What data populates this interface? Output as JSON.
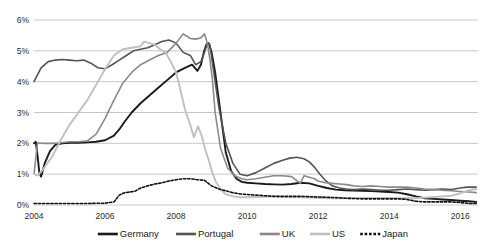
{
  "chart_data": {
    "type": "line",
    "title": "",
    "xlabel": "",
    "ylabel": "",
    "xlim": [
      2004.0,
      2016.5
    ],
    "ylim": [
      0,
      6
    ],
    "ytick_labels": [
      "0%",
      "1%",
      "2%",
      "3%",
      "4%",
      "5%",
      "6%"
    ],
    "ytick_values": [
      0,
      1,
      2,
      3,
      4,
      5,
      6
    ],
    "xtick_labels": [
      "2004",
      "2006",
      "2008",
      "2010",
      "2012",
      "2014",
      "2016"
    ],
    "xtick_values": [
      2004,
      2006,
      2008,
      2010,
      2012,
      2014,
      2016
    ],
    "grid": "horizontal",
    "legend_position": "bottom",
    "series": [
      {
        "name": "Germany",
        "color": "#1a1a1a",
        "width": 1.9,
        "dash": "none",
        "x": [
          2004.0,
          2004.05,
          2004.1,
          2004.15,
          2004.2,
          2004.3,
          2004.45,
          2004.6,
          2004.8,
          2005.0,
          2005.25,
          2005.5,
          2005.75,
          2006.0,
          2006.25,
          2006.4,
          2006.55,
          2006.75,
          2007.0,
          2007.25,
          2007.5,
          2007.75,
          2008.0,
          2008.25,
          2008.45,
          2008.6,
          2008.7,
          2008.78,
          2008.85,
          2008.92,
          2009.0,
          2009.1,
          2009.25,
          2009.4,
          2009.55,
          2009.7,
          2009.85,
          2010.0,
          2010.25,
          2010.5,
          2010.75,
          2011.0,
          2011.25,
          2011.5,
          2011.75,
          2012.0,
          2012.25,
          2012.5,
          2012.75,
          2013.0,
          2013.25,
          2013.5,
          2013.75,
          2014.0,
          2014.25,
          2014.5,
          2014.75,
          2015.0,
          2015.25,
          2015.5,
          2015.75,
          2016.0,
          2016.25,
          2016.45
        ],
        "y": [
          2.0,
          2.05,
          1.6,
          1.05,
          0.92,
          1.35,
          1.75,
          1.95,
          2.0,
          2.02,
          2.02,
          2.03,
          2.05,
          2.1,
          2.25,
          2.45,
          2.7,
          3.0,
          3.3,
          3.55,
          3.8,
          4.05,
          4.3,
          4.45,
          4.55,
          4.35,
          4.55,
          4.95,
          5.2,
          5.25,
          4.95,
          4.3,
          3.0,
          1.7,
          1.1,
          0.85,
          0.75,
          0.72,
          0.7,
          0.68,
          0.67,
          0.66,
          0.68,
          0.72,
          0.7,
          0.62,
          0.55,
          0.5,
          0.48,
          0.47,
          0.46,
          0.45,
          0.44,
          0.42,
          0.4,
          0.35,
          0.28,
          0.22,
          0.2,
          0.18,
          0.16,
          0.14,
          0.12,
          0.1
        ]
      },
      {
        "name": "Portugal",
        "color": "#545454",
        "width": 1.6,
        "dash": "none",
        "x": [
          2004.0,
          2004.2,
          2004.4,
          2004.6,
          2004.8,
          2005.0,
          2005.2,
          2005.4,
          2005.6,
          2005.8,
          2006.0,
          2006.2,
          2006.4,
          2006.6,
          2006.8,
          2007.0,
          2007.2,
          2007.4,
          2007.6,
          2007.8,
          2008.0,
          2008.2,
          2008.4,
          2008.55,
          2008.7,
          2008.8,
          2008.88,
          2008.95,
          2009.05,
          2009.2,
          2009.4,
          2009.6,
          2009.8,
          2010.0,
          2010.25,
          2010.5,
          2010.75,
          2011.0,
          2011.2,
          2011.4,
          2011.6,
          2011.75,
          2011.9,
          2012.05,
          2012.2,
          2012.4,
          2012.6,
          2012.8,
          2013.0,
          2013.25,
          2013.5,
          2013.75,
          2014.0,
          2014.25,
          2014.5,
          2014.75,
          2015.0,
          2015.25,
          2015.5,
          2015.75,
          2016.0,
          2016.2,
          2016.45
        ],
        "y": [
          4.0,
          4.45,
          4.65,
          4.7,
          4.72,
          4.7,
          4.68,
          4.7,
          4.6,
          4.45,
          4.42,
          4.55,
          4.7,
          4.85,
          5.0,
          5.05,
          5.1,
          5.2,
          5.3,
          5.35,
          5.25,
          4.95,
          4.85,
          4.55,
          4.65,
          4.95,
          5.25,
          5.2,
          4.4,
          3.2,
          2.0,
          1.35,
          1.0,
          0.95,
          1.05,
          1.2,
          1.35,
          1.45,
          1.52,
          1.55,
          1.5,
          1.4,
          1.22,
          1.0,
          0.8,
          0.62,
          0.55,
          0.52,
          0.5,
          0.52,
          0.5,
          0.48,
          0.48,
          0.5,
          0.52,
          0.5,
          0.48,
          0.5,
          0.52,
          0.5,
          0.55,
          0.58,
          0.58
        ]
      },
      {
        "name": "UK",
        "color": "#8a8a8a",
        "width": 1.6,
        "dash": "none",
        "x": [
          2004.0,
          2004.1,
          2004.25,
          2004.5,
          2004.75,
          2005.0,
          2005.25,
          2005.5,
          2005.75,
          2006.0,
          2006.25,
          2006.5,
          2006.75,
          2007.0,
          2007.25,
          2007.5,
          2007.75,
          2008.0,
          2008.2,
          2008.4,
          2008.55,
          2008.7,
          2008.8,
          2008.88,
          2008.95,
          2009.02,
          2009.1,
          2009.25,
          2009.45,
          2009.65,
          2009.85,
          2010.0,
          2010.25,
          2010.5,
          2010.75,
          2011.0,
          2011.25,
          2011.5,
          2011.6,
          2011.75,
          2011.9,
          2012.0,
          2012.2,
          2012.4,
          2012.6,
          2012.8,
          2013.0,
          2013.25,
          2013.5,
          2013.75,
          2014.0,
          2014.25,
          2014.5,
          2014.75,
          2015.0,
          2015.25,
          2015.5,
          2015.75,
          2016.0,
          2016.25,
          2016.45
        ],
        "y": [
          1.0,
          2.02,
          2.0,
          2.0,
          2.02,
          2.05,
          2.05,
          2.08,
          2.3,
          2.8,
          3.4,
          3.95,
          4.3,
          4.55,
          4.7,
          4.85,
          4.95,
          5.25,
          5.55,
          5.4,
          5.38,
          5.42,
          5.55,
          5.25,
          4.75,
          4.1,
          3.0,
          1.85,
          1.2,
          0.95,
          0.85,
          0.82,
          0.85,
          0.9,
          0.95,
          0.95,
          0.92,
          0.7,
          0.95,
          0.9,
          0.85,
          0.78,
          0.72,
          0.7,
          0.68,
          0.66,
          0.62,
          0.6,
          0.62,
          0.6,
          0.58,
          0.58,
          0.58,
          0.55,
          0.52,
          0.5,
          0.48,
          0.46,
          0.44,
          0.42,
          0.4
        ]
      },
      {
        "name": "US",
        "color": "#c0c0c0",
        "width": 1.9,
        "dash": "none",
        "x": [
          2004.0,
          2004.1,
          2004.25,
          2004.5,
          2004.75,
          2005.0,
          2005.25,
          2005.5,
          2005.75,
          2006.0,
          2006.25,
          2006.5,
          2006.75,
          2007.0,
          2007.1,
          2007.25,
          2007.4,
          2007.55,
          2007.7,
          2007.85,
          2008.0,
          2008.15,
          2008.25,
          2008.4,
          2008.5,
          2008.62,
          2008.72,
          2008.82,
          2008.92,
          2009.02,
          2009.12,
          2009.25,
          2009.4,
          2009.6,
          2009.8,
          2010.0,
          2010.25,
          2010.5,
          2010.75,
          2011.0,
          2011.25,
          2011.5,
          2011.75,
          2012.0,
          2012.25,
          2012.5,
          2012.75,
          2013.0,
          2013.25,
          2013.5,
          2013.75,
          2014.0,
          2014.25,
          2014.5,
          2014.75,
          2015.0,
          2015.25,
          2015.5,
          2015.75,
          2016.0,
          2016.25,
          2016.45
        ],
        "y": [
          1.0,
          0.95,
          1.15,
          1.55,
          2.1,
          2.6,
          3.0,
          3.4,
          3.9,
          4.4,
          4.85,
          5.05,
          5.1,
          5.15,
          5.3,
          5.25,
          5.2,
          5.05,
          4.95,
          4.65,
          4.3,
          3.6,
          3.1,
          2.6,
          2.2,
          2.55,
          2.25,
          1.8,
          1.45,
          1.05,
          0.75,
          0.5,
          0.35,
          0.28,
          0.25,
          0.25,
          0.26,
          0.27,
          0.28,
          0.26,
          0.25,
          0.25,
          0.24,
          0.23,
          0.22,
          0.22,
          0.22,
          0.22,
          0.23,
          0.23,
          0.23,
          0.23,
          0.22,
          0.22,
          0.22,
          0.24,
          0.26,
          0.28,
          0.3,
          0.38,
          0.48,
          0.52
        ]
      },
      {
        "name": "Japan",
        "color": "#111111",
        "width": 1.6,
        "dash": "2.4,1.8",
        "x": [
          2004.0,
          2004.5,
          2005.0,
          2005.5,
          2006.0,
          2006.25,
          2006.4,
          2006.55,
          2006.7,
          2006.85,
          2007.0,
          2007.2,
          2007.4,
          2007.6,
          2007.8,
          2008.0,
          2008.2,
          2008.4,
          2008.6,
          2008.8,
          2009.0,
          2009.2,
          2009.4,
          2009.6,
          2009.8,
          2010.0,
          2010.25,
          2010.5,
          2010.75,
          2011.0,
          2011.25,
          2011.5,
          2011.75,
          2012.0,
          2012.25,
          2012.5,
          2012.75,
          2013.0,
          2013.25,
          2013.5,
          2013.75,
          2014.0,
          2014.25,
          2014.5,
          2014.75,
          2015.0,
          2015.25,
          2015.5,
          2015.75,
          2016.0,
          2016.25,
          2016.45
        ],
        "y": [
          0.05,
          0.05,
          0.05,
          0.05,
          0.06,
          0.1,
          0.32,
          0.4,
          0.42,
          0.45,
          0.55,
          0.62,
          0.68,
          0.72,
          0.78,
          0.82,
          0.85,
          0.85,
          0.82,
          0.8,
          0.62,
          0.52,
          0.46,
          0.4,
          0.36,
          0.34,
          0.32,
          0.3,
          0.28,
          0.28,
          0.28,
          0.28,
          0.27,
          0.26,
          0.25,
          0.24,
          0.22,
          0.21,
          0.2,
          0.2,
          0.2,
          0.2,
          0.2,
          0.18,
          0.12,
          0.1,
          0.1,
          0.1,
          0.1,
          0.08,
          0.05,
          0.05
        ]
      }
    ]
  },
  "legend": {
    "items": [
      {
        "label": "Germany",
        "color": "#1a1a1a",
        "dashed": false
      },
      {
        "label": "Portugal",
        "color": "#545454",
        "dashed": false
      },
      {
        "label": "UK",
        "color": "#8a8a8a",
        "dashed": false
      },
      {
        "label": "US",
        "color": "#c0c0c0",
        "dashed": false
      },
      {
        "label": "Japan",
        "color": "#111111",
        "dashed": true
      }
    ]
  }
}
